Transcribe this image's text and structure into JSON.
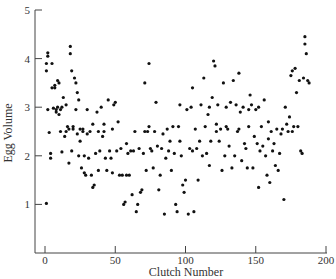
{
  "chart_data": {
    "type": "scatter",
    "title": "",
    "xlabel": "Clutch Number",
    "ylabel": "Egg Volume",
    "xlim": [
      0,
      200
    ],
    "ylim": [
      0,
      5
    ],
    "xticks": [
      0,
      50,
      100,
      150,
      200
    ],
    "yticks": [
      1,
      2,
      3,
      4,
      5
    ],
    "grid": false,
    "legend": null,
    "marker_color": "#111111",
    "points": [
      [
        1,
        3.9
      ],
      [
        1,
        3.75
      ],
      [
        1,
        1.02
      ],
      [
        2,
        2.95
      ],
      [
        2,
        4.12
      ],
      [
        2,
        4.05
      ],
      [
        3,
        2.48
      ],
      [
        4,
        1.95
      ],
      [
        4,
        2.05
      ],
      [
        5,
        3.4
      ],
      [
        5,
        3.9
      ],
      [
        6,
        2.98
      ],
      [
        7,
        3.4
      ],
      [
        7,
        3.45
      ],
      [
        8,
        2.9
      ],
      [
        8,
        2.95
      ],
      [
        9,
        3.0
      ],
      [
        9,
        3.55
      ],
      [
        10,
        2.85
      ],
      [
        10,
        3.5
      ],
      [
        11,
        2.5
      ],
      [
        11,
        2.95
      ],
      [
        12,
        3.0
      ],
      [
        12,
        2.08
      ],
      [
        13,
        3.2
      ],
      [
        14,
        2.4
      ],
      [
        15,
        3.05
      ],
      [
        15,
        2.5
      ],
      [
        16,
        2.6
      ],
      [
        17,
        2.55
      ],
      [
        17,
        1.85
      ],
      [
        18,
        4.25
      ],
      [
        18,
        4.1
      ],
      [
        19,
        3.75
      ],
      [
        19,
        2.1
      ],
      [
        20,
        2.6
      ],
      [
        20,
        2.55
      ],
      [
        21,
        3.6
      ],
      [
        22,
        3.5
      ],
      [
        22,
        2.95
      ],
      [
        23,
        3.3
      ],
      [
        23,
        2.45
      ],
      [
        24,
        3.15
      ],
      [
        24,
        2.0
      ],
      [
        25,
        2.55
      ],
      [
        25,
        2.3
      ],
      [
        26,
        1.75
      ],
      [
        27,
        2.55
      ],
      [
        27,
        2.5
      ],
      [
        28,
        2.0
      ],
      [
        28,
        1.65
      ],
      [
        29,
        1.6
      ],
      [
        30,
        2.95
      ],
      [
        30,
        2.45
      ],
      [
        31,
        1.95
      ],
      [
        32,
        2.5
      ],
      [
        33,
        1.6
      ],
      [
        34,
        2.65
      ],
      [
        34,
        1.35
      ],
      [
        35,
        1.4
      ],
      [
        36,
        2.05
      ],
      [
        37,
        2.9
      ],
      [
        38,
        2.5
      ],
      [
        38,
        1.7
      ],
      [
        39,
        2.1
      ],
      [
        40,
        3.0
      ],
      [
        41,
        2.4
      ],
      [
        42,
        2.65
      ],
      [
        42,
        2.5
      ],
      [
        43,
        1.95
      ],
      [
        44,
        1.7
      ],
      [
        45,
        3.15
      ],
      [
        46,
        2.1
      ],
      [
        47,
        1.95
      ],
      [
        48,
        2.55
      ],
      [
        48,
        1.65
      ],
      [
        49,
        3.05
      ],
      [
        50,
        3.1
      ],
      [
        51,
        2.1
      ],
      [
        52,
        2.7
      ],
      [
        53,
        1.6
      ],
      [
        54,
        2.15
      ],
      [
        55,
        1.6
      ],
      [
        56,
        1.0
      ],
      [
        57,
        1.05
      ],
      [
        58,
        2.25
      ],
      [
        58,
        1.6
      ],
      [
        59,
        2.05
      ],
      [
        60,
        1.6
      ],
      [
        61,
        2.1
      ],
      [
        62,
        1.2
      ],
      [
        63,
        2.1
      ],
      [
        64,
        2.5
      ],
      [
        65,
        0.85
      ],
      [
        66,
        1.0
      ],
      [
        67,
        2.15
      ],
      [
        68,
        1.25
      ],
      [
        69,
        1.3
      ],
      [
        70,
        2.05
      ],
      [
        71,
        3.5
      ],
      [
        71,
        2.5
      ],
      [
        72,
        1.7
      ],
      [
        73,
        2.5
      ],
      [
        74,
        2.6
      ],
      [
        74,
        3.9
      ],
      [
        75,
        2.15
      ],
      [
        76,
        2.1
      ],
      [
        77,
        1.75
      ],
      [
        78,
        2.5
      ],
      [
        79,
        3.1
      ],
      [
        80,
        2.2
      ],
      [
        81,
        1.3
      ],
      [
        82,
        1.6
      ],
      [
        83,
        2.15
      ],
      [
        84,
        2.45
      ],
      [
        85,
        0.8
      ],
      [
        86,
        1.95
      ],
      [
        87,
        2.55
      ],
      [
        88,
        2.1
      ],
      [
        89,
        2.3
      ],
      [
        90,
        1.7
      ],
      [
        91,
        2.6
      ],
      [
        92,
        2.05
      ],
      [
        93,
        1.0
      ],
      [
        94,
        0.85
      ],
      [
        95,
        2.6
      ],
      [
        96,
        3.05
      ],
      [
        96,
        2.3
      ],
      [
        97,
        2.0
      ],
      [
        98,
        1.4
      ],
      [
        99,
        1.25
      ],
      [
        100,
        1.5
      ],
      [
        101,
        2.95
      ],
      [
        102,
        0.8
      ],
      [
        103,
        2.15
      ],
      [
        104,
        3.0
      ],
      [
        105,
        3.4
      ],
      [
        105,
        2.1
      ],
      [
        106,
        0.85
      ],
      [
        107,
        2.55
      ],
      [
        108,
        2.15
      ],
      [
        109,
        1.5
      ],
      [
        110,
        2.3
      ],
      [
        111,
        3.05
      ],
      [
        112,
        2.0
      ],
      [
        113,
        3.6
      ],
      [
        114,
        2.6
      ],
      [
        115,
        2.05
      ],
      [
        116,
        2.85
      ],
      [
        117,
        1.8
      ],
      [
        117,
        3.0
      ],
      [
        118,
        2.3
      ],
      [
        119,
        3.2
      ],
      [
        120,
        3.95
      ],
      [
        121,
        3.85
      ],
      [
        122,
        2.65
      ],
      [
        122,
        2.5
      ],
      [
        123,
        3.05
      ],
      [
        124,
        2.3
      ],
      [
        125,
        2.55
      ],
      [
        126,
        1.7
      ],
      [
        127,
        3.5
      ],
      [
        128,
        2.0
      ],
      [
        129,
        3.0
      ],
      [
        129,
        2.6
      ],
      [
        130,
        2.55
      ],
      [
        131,
        2.2
      ],
      [
        132,
        3.1
      ],
      [
        133,
        1.75
      ],
      [
        134,
        3.55
      ],
      [
        135,
        2.0
      ],
      [
        136,
        3.05
      ],
      [
        137,
        2.5
      ],
      [
        138,
        3.7
      ],
      [
        138,
        2.55
      ],
      [
        139,
        2.9
      ],
      [
        140,
        1.9
      ],
      [
        141,
        3.0
      ],
      [
        142,
        2.25
      ],
      [
        143,
        2.15
      ],
      [
        144,
        1.75
      ],
      [
        145,
        2.6
      ],
      [
        145,
        2.95
      ],
      [
        146,
        3.25
      ],
      [
        147,
        3.05
      ],
      [
        148,
        1.75
      ],
      [
        149,
        2.4
      ],
      [
        150,
        2.95
      ],
      [
        151,
        2.25
      ],
      [
        152,
        3.0
      ],
      [
        152,
        1.35
      ],
      [
        153,
        2.1
      ],
      [
        154,
        2.6
      ],
      [
        155,
        2.2
      ],
      [
        156,
        3.15
      ],
      [
        157,
        2.0
      ],
      [
        158,
        1.6
      ],
      [
        159,
        2.7
      ],
      [
        159,
        2.35
      ],
      [
        160,
        1.45
      ],
      [
        161,
        2.5
      ],
      [
        162,
        2.1
      ],
      [
        163,
        2.25
      ],
      [
        164,
        1.8
      ],
      [
        165,
        2.55
      ],
      [
        166,
        1.7
      ],
      [
        167,
        2.05
      ],
      [
        168,
        2.45
      ],
      [
        169,
        2.55
      ],
      [
        170,
        1.1
      ],
      [
        171,
        3.0
      ],
      [
        172,
        2.65
      ],
      [
        173,
        2.5
      ],
      [
        174,
        2.8
      ],
      [
        175,
        3.65
      ],
      [
        176,
        3.75
      ],
      [
        176,
        2.5
      ],
      [
        177,
        2.6
      ],
      [
        178,
        3.8
      ],
      [
        179,
        3.3
      ],
      [
        180,
        2.6
      ],
      [
        181,
        3.55
      ],
      [
        182,
        2.1
      ],
      [
        183,
        2.05
      ],
      [
        184,
        3.6
      ],
      [
        185,
        4.45
      ],
      [
        185,
        4.3
      ],
      [
        186,
        4.1
      ],
      [
        187,
        3.55
      ],
      [
        188,
        3.5
      ]
    ]
  }
}
